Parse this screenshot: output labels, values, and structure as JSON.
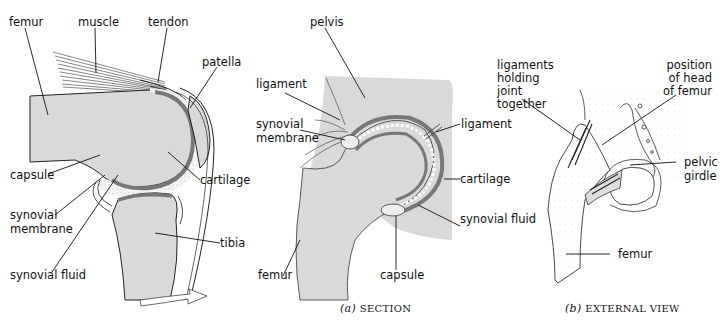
{
  "figure_a_knee": {
    "labels": {
      "femur": "femur",
      "muscle": "muscle",
      "tendon": "tendon",
      "patella": "patella",
      "capsule": "capsule",
      "cartilage": "cartilage",
      "synovial_membrane_1": "synovial",
      "synovial_membrane_2": "membrane",
      "tibia": "tibia",
      "synovial_fluid": "synovial fluid"
    }
  },
  "figure_b_hip_section": {
    "labels": {
      "pelvis": "pelvis",
      "ligament_left": "ligament",
      "synovial_membrane_1": "synovial",
      "synovial_membrane_2": "membrane",
      "ligament_right": "ligament",
      "cartilage": "cartilage",
      "synovial_fluid": "synovial fluid",
      "femur": "femur",
      "capsule": "capsule"
    },
    "caption_letter": "(a)",
    "caption_text": "SECTION"
  },
  "figure_c_hip_external": {
    "labels": {
      "ligaments_1": "ligaments",
      "ligaments_2": "holding",
      "ligaments_3": "joint",
      "ligaments_4": "together",
      "position_1": "position",
      "position_2": "of head",
      "position_3": "of femur",
      "pelvic_1": "pelvic",
      "pelvic_2": "girdle",
      "femur": "femur"
    },
    "caption_letter": "(b)",
    "caption_text": "EXTERNAL VIEW"
  },
  "colors": {
    "bone": "#d9d9d9",
    "cartilage": "#8a8a8a",
    "ink": "#111111"
  }
}
